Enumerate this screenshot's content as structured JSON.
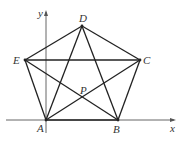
{
  "diagram": {
    "type": "pentagon-with-diagonals",
    "axes": {
      "x_label": "x",
      "y_label": "y"
    },
    "points": {
      "A": {
        "label": "A",
        "px": [
          46,
          120
        ],
        "label_pos": [
          37,
          124
        ]
      },
      "B": {
        "label": "B",
        "px": [
          118,
          120
        ],
        "label_pos": [
          113,
          125
        ]
      },
      "C": {
        "label": "C",
        "px": [
          140,
          60
        ],
        "label_pos": [
          143,
          55
        ]
      },
      "D": {
        "label": "D",
        "px": [
          82,
          26
        ],
        "label_pos": [
          79,
          13
        ]
      },
      "E": {
        "label": "E",
        "px": [
          25,
          60
        ],
        "label_pos": [
          14,
          55
        ]
      },
      "P": {
        "label": "P",
        "px": [
          83,
          98
        ],
        "label_pos": [
          81,
          85
        ]
      }
    },
    "edges": [
      "AB",
      "BC",
      "CD",
      "DE",
      "EA"
    ],
    "diagonals": [
      "AC",
      "AD",
      "BD",
      "BE",
      "CE"
    ],
    "colors": {
      "stroke": "#222222",
      "axis": "#555555",
      "label": "#333333"
    }
  }
}
